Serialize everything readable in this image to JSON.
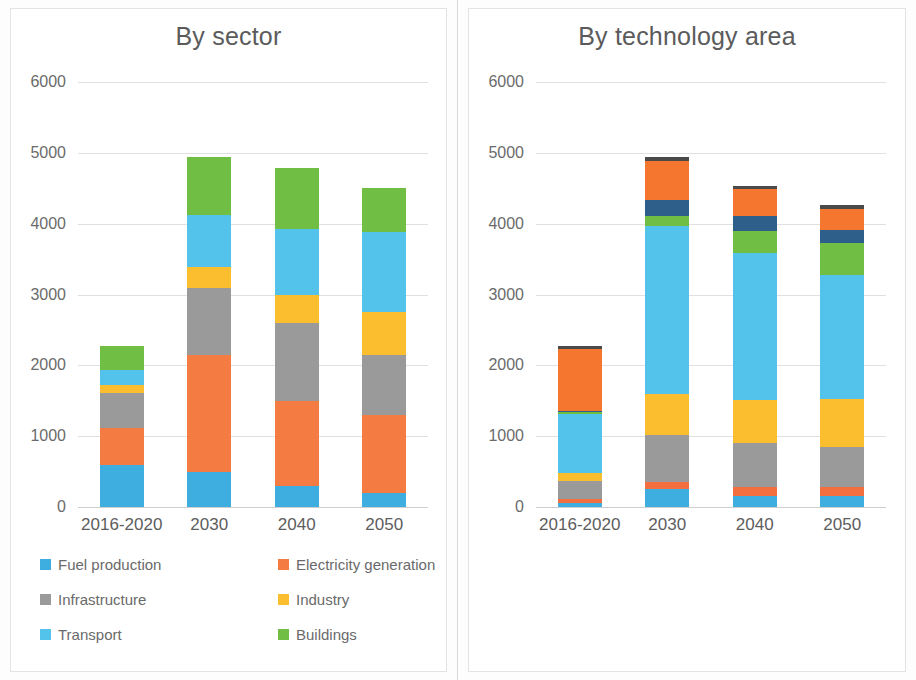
{
  "page": {
    "background": "#ffffff",
    "panel_divider_color": "#d8d8d8"
  },
  "charts": [
    {
      "id": "by-sector",
      "title": "By sector",
      "legend_columns": 2
    },
    {
      "id": "by-technology-area",
      "title": "By technology area",
      "legend_columns": 2
    }
  ],
  "chart_data": [
    {
      "type": "bar",
      "subtype": "stacked-column",
      "title": "By sector",
      "xlabel": "",
      "ylabel": "",
      "ylim": [
        0,
        6000
      ],
      "yticks": [
        0,
        1000,
        2000,
        3000,
        4000,
        5000,
        6000
      ],
      "ytick_labels": [
        "0",
        "1000",
        "2000",
        "3000",
        "4000",
        "5000",
        "6000"
      ],
      "grid": true,
      "legend_position": "bottom",
      "categories": [
        "2016-2020",
        "2030",
        "2040",
        "2050"
      ],
      "series": [
        {
          "name": "Fuel production",
          "color": "#3eaee0",
          "values": [
            600,
            500,
            300,
            200
          ]
        },
        {
          "name": "Electricity generation",
          "color": "#f47b41",
          "values": [
            520,
            1650,
            1200,
            1100
          ]
        },
        {
          "name": "Infrastructure",
          "color": "#9a9a9a",
          "values": [
            490,
            940,
            1100,
            850
          ]
        },
        {
          "name": "Industry",
          "color": "#fbbe2e",
          "values": [
            110,
            300,
            400,
            600
          ]
        },
        {
          "name": "Transport",
          "color": "#54c3eb",
          "values": [
            220,
            730,
            930,
            1130
          ]
        },
        {
          "name": "Buildings",
          "color": "#70bf44",
          "values": [
            340,
            820,
            850,
            620
          ]
        }
      ],
      "totals": [
        2280,
        4940,
        4780,
        4500
      ]
    },
    {
      "type": "bar",
      "subtype": "stacked-column",
      "title": "By technology area",
      "xlabel": "",
      "ylabel": "",
      "ylim": [
        0,
        6000
      ],
      "yticks": [
        0,
        1000,
        2000,
        3000,
        4000,
        5000,
        6000
      ],
      "ytick_labels": [
        "0",
        "1000",
        "2000",
        "3000",
        "4000",
        "5000",
        "6000"
      ],
      "grid": true,
      "legend_position": "bottom",
      "categories": [
        "2016-2020",
        "2030",
        "2040",
        "2050"
      ],
      "series": [
        {
          "name": "Bioenergy",
          "color": "#3eaee0",
          "values": [
            50,
            250,
            160,
            150
          ]
        },
        {
          "name": "Other renewables",
          "color": "#f46f3f",
          "values": [
            70,
            100,
            120,
            130
          ]
        },
        {
          "name": "Efficiency",
          "color": "#9a9a9a",
          "values": [
            250,
            660,
            630,
            570
          ]
        },
        {
          "name": "Electrification",
          "color": "#fbbe2e",
          "values": [
            110,
            590,
            600,
            670
          ]
        },
        {
          "name": "Electricity system",
          "color": "#54c3eb",
          "values": [
            840,
            2370,
            2080,
            1760
          ]
        },
        {
          "name": "Hydrogen",
          "color": "#70bf44",
          "values": [
            20,
            140,
            310,
            450
          ]
        },
        {
          "name": "CCUS",
          "color": "#2e5f8a",
          "values": [
            10,
            230,
            210,
            180
          ]
        },
        {
          "name": "Fossil fuels",
          "color": "#f4762f",
          "values": [
            880,
            540,
            380,
            300
          ]
        },
        {
          "name": "Other",
          "color": "#4a4a4a",
          "values": [
            50,
            60,
            40,
            50
          ]
        }
      ],
      "totals": [
        2280,
        4940,
        4530,
        4260
      ]
    }
  ]
}
